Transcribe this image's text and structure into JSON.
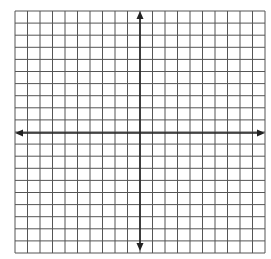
{
  "diagram": {
    "type": "coordinate-grid",
    "columns": 20,
    "rows": 20,
    "grid": {
      "left": 15,
      "top": 11,
      "right": 265,
      "bottom": 253
    },
    "axis_origin": {
      "x": 140,
      "y": 133
    },
    "axes": {
      "x_axis": {
        "left_arrow_x": 15,
        "right_arrow_x": 265,
        "arrows": true
      },
      "y_axis": {
        "top_arrow_y": 11,
        "bottom_arrow_y": 251,
        "arrows": true
      }
    },
    "colors": {
      "grid_line": "#555555",
      "axis_line": "#222222",
      "background": "#ffffff"
    }
  }
}
